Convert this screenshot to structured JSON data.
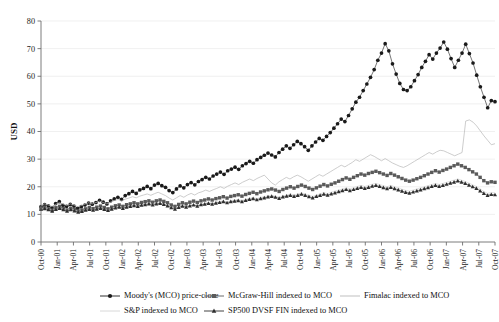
{
  "chart_data": {
    "type": "line",
    "title": "",
    "xlabel": "",
    "ylabel": "USD",
    "ylim": [
      0,
      80
    ],
    "yticks": [
      0,
      10,
      20,
      30,
      40,
      50,
      60,
      70,
      80
    ],
    "grid": true,
    "legend_position": "bottom",
    "tick_labels": [
      "Oct-00",
      "Jan-01",
      "Apr-01",
      "Jul-01",
      "Oct-01",
      "Jan-02",
      "Apr-02",
      "Jul-02",
      "Oct-02",
      "Jan-03",
      "Apr-03",
      "Jul-03",
      "Oct-03",
      "Jan-04",
      "Apr-04",
      "Jul-04",
      "Oct-04",
      "Jan-05",
      "Apr-05",
      "Jul-05",
      "Oct-05",
      "Jan-06",
      "Apr-06",
      "Jul-06",
      "Oct-06",
      "Jan-07",
      "Apr-07",
      "Jul-07",
      "Oct-07"
    ],
    "series": [
      {
        "name": "Moody's (MCO) price-close",
        "marker": "diamond",
        "color": "#1a1a1a",
        "values": [
          12.8,
          13.5,
          13.1,
          12.4,
          13.9,
          14.6,
          13.3,
          12.9,
          13.6,
          13.0,
          12.2,
          12.8,
          13.4,
          14.1,
          13.7,
          14.3,
          15.1,
          14.4,
          13.8,
          14.9,
          15.6,
          16.2,
          15.4,
          16.8,
          17.5,
          18.3,
          17.6,
          18.9,
          19.4,
          20.1,
          19.3,
          20.6,
          21.2,
          20.4,
          19.8,
          18.6,
          17.9,
          19.2,
          20.3,
          19.6,
          20.8,
          21.5,
          20.7,
          21.9,
          22.6,
          23.4,
          22.8,
          23.9,
          24.6,
          25.3,
          24.5,
          25.8,
          26.4,
          27.1,
          26.3,
          27.6,
          28.4,
          29.2,
          28.5,
          29.8,
          30.6,
          31.4,
          32.2,
          31.5,
          30.8,
          32.4,
          33.6,
          34.8,
          33.9,
          35.2,
          36.4,
          35.6,
          34.5,
          33.2,
          34.8,
          36.2,
          37.5,
          36.8,
          38.2,
          39.6,
          41.2,
          42.8,
          44.5,
          43.6,
          45.8,
          48.2,
          50.6,
          52.4,
          54.8,
          57.2,
          59.6,
          62.4,
          65.8,
          68.4,
          71.8,
          69.2,
          64.5,
          60.8,
          57.4,
          55.2,
          54.8,
          56.2,
          58.4,
          60.6,
          63.2,
          65.4,
          67.8,
          66.2,
          68.4,
          70.2,
          72.4,
          69.8,
          66.4,
          63.2,
          65.8,
          68.4,
          71.6,
          68.2,
          64.8,
          60.4,
          56.2,
          52.4,
          48.6,
          51.2,
          50.8
        ]
      },
      {
        "name": "McGraw-Hill indexed to MCO",
        "marker": "square",
        "color": "#5a5a5a",
        "values": [
          12.2,
          12.6,
          12.0,
          11.5,
          12.4,
          12.9,
          12.1,
          11.6,
          12.2,
          11.8,
          11.2,
          11.6,
          12.0,
          12.5,
          12.1,
          12.6,
          13.0,
          12.5,
          12.0,
          12.6,
          13.1,
          13.4,
          12.9,
          13.5,
          13.8,
          14.2,
          13.8,
          14.3,
          14.6,
          14.9,
          14.4,
          14.9,
          15.2,
          14.7,
          14.2,
          13.4,
          12.9,
          13.6,
          14.2,
          13.8,
          14.4,
          14.8,
          14.3,
          14.9,
          15.2,
          15.6,
          15.2,
          15.7,
          16.0,
          16.4,
          15.9,
          16.5,
          16.8,
          17.1,
          16.6,
          17.2,
          17.6,
          18.0,
          17.5,
          18.1,
          18.5,
          18.9,
          19.2,
          18.8,
          18.3,
          19.0,
          19.5,
          20.0,
          19.5,
          20.1,
          20.6,
          20.1,
          19.5,
          19.0,
          19.6,
          20.2,
          20.8,
          20.3,
          20.9,
          21.4,
          22.0,
          22.6,
          23.2,
          22.7,
          23.4,
          24.0,
          24.6,
          24.2,
          24.8,
          25.2,
          25.6,
          25.1,
          24.6,
          24.1,
          24.8,
          24.2,
          23.6,
          23.0,
          22.4,
          22.0,
          22.4,
          22.9,
          23.4,
          24.0,
          24.6,
          25.2,
          25.8,
          25.3,
          25.9,
          26.4,
          27.0,
          27.6,
          28.2,
          27.6,
          27.0,
          26.2,
          25.4,
          24.6,
          23.4,
          22.2,
          21.4,
          21.8,
          21.6
        ]
      },
      {
        "name": "Fimalac indexed to MCO",
        "marker": "none",
        "color": "#b8b8b8",
        "values": [
          13.2,
          13.8,
          13.4,
          12.9,
          13.6,
          14.2,
          13.8,
          13.2,
          13.8,
          13.4,
          12.8,
          13.2,
          13.7,
          14.2,
          13.8,
          14.3,
          14.8,
          14.3,
          13.8,
          14.4,
          15.0,
          15.4,
          14.9,
          15.5,
          15.9,
          16.4,
          16.0,
          16.6,
          17.0,
          17.4,
          16.9,
          17.5,
          18.0,
          17.4,
          16.8,
          15.9,
          15.2,
          16.0,
          16.8,
          16.2,
          17.0,
          17.6,
          17.0,
          17.8,
          18.2,
          18.8,
          18.3,
          18.9,
          19.4,
          20.0,
          19.4,
          20.2,
          20.8,
          21.4,
          20.8,
          21.6,
          22.2,
          22.8,
          22.2,
          23.0,
          23.6,
          24.2,
          22.8,
          21.4,
          20.6,
          21.8,
          22.6,
          23.4,
          22.8,
          23.6,
          24.2,
          23.6,
          22.8,
          22.0,
          22.8,
          23.6,
          24.4,
          23.8,
          24.6,
          25.4,
          26.2,
          27.0,
          27.8,
          27.2,
          28.0,
          28.8,
          29.8,
          29.2,
          30.0,
          30.8,
          31.6,
          31.0,
          30.2,
          29.4,
          30.2,
          29.4,
          28.6,
          28.0,
          27.4,
          27.0,
          27.6,
          28.4,
          29.2,
          30.0,
          30.8,
          31.6,
          32.4,
          31.8,
          32.6,
          33.2,
          33.0,
          32.4,
          31.8,
          31.2,
          31.8,
          32.4,
          43.8,
          44.2,
          43.4,
          42.0,
          40.2,
          38.4,
          36.8,
          35.2,
          35.6
        ]
      },
      {
        "name": "S&P indexed to MCO",
        "marker": "none",
        "color": "#d4d4d4",
        "values": [
          12.0,
          12.3,
          11.9,
          11.4,
          12.0,
          12.4,
          11.9,
          11.4,
          11.9,
          11.5,
          11.0,
          11.3,
          11.7,
          12.0,
          11.7,
          12.1,
          12.4,
          12.0,
          11.6,
          12.1,
          12.5,
          12.8,
          12.4,
          12.8,
          13.1,
          13.4,
          13.1,
          13.5,
          13.7,
          14.0,
          13.6,
          14.0,
          14.2,
          13.8,
          13.3,
          12.6,
          12.1,
          12.7,
          13.2,
          12.8,
          13.3,
          13.6,
          13.2,
          13.7,
          14.0,
          14.3,
          14.0,
          14.4,
          14.6,
          14.9,
          14.5,
          15.0,
          15.2,
          15.4,
          15.0,
          15.5,
          15.8,
          16.1,
          15.7,
          16.1,
          16.4,
          16.7,
          16.9,
          16.6,
          16.2,
          16.7,
          17.0,
          17.4,
          17.0,
          17.4,
          17.8,
          17.4,
          16.9,
          16.5,
          17.0,
          17.4,
          17.9,
          17.5,
          18.0,
          18.4,
          18.8,
          19.2,
          19.6,
          19.2,
          19.7,
          20.1,
          20.5,
          20.1,
          20.5,
          20.9,
          21.2,
          20.8,
          20.4,
          20.0,
          20.5,
          20.0,
          19.6,
          19.1,
          18.7,
          18.4,
          18.8,
          19.2,
          19.6,
          20.0,
          20.4,
          20.8,
          21.2,
          20.8,
          21.2,
          21.6,
          22.0,
          22.4,
          22.8,
          22.4,
          21.9,
          21.3,
          20.7,
          20.1,
          19.2,
          18.3,
          17.6,
          17.9,
          17.8
        ]
      },
      {
        "name": "SP500 DVSF FIN indexed to MCO",
        "marker": "triangle",
        "color": "#2e2e2e",
        "values": [
          11.8,
          12.1,
          11.7,
          11.2,
          11.8,
          12.2,
          11.7,
          11.2,
          11.7,
          11.3,
          10.8,
          11.1,
          11.5,
          11.8,
          11.5,
          11.9,
          12.2,
          11.8,
          11.4,
          11.9,
          12.3,
          12.6,
          12.2,
          12.6,
          12.9,
          13.2,
          12.9,
          13.3,
          13.5,
          13.8,
          13.4,
          13.8,
          14.0,
          13.6,
          13.1,
          12.4,
          11.9,
          12.5,
          13.0,
          12.6,
          13.1,
          13.4,
          13.0,
          13.5,
          13.7,
          14.0,
          13.7,
          14.1,
          14.3,
          14.6,
          14.2,
          14.6,
          14.8,
          15.0,
          14.6,
          15.1,
          15.4,
          15.7,
          15.3,
          15.7,
          16.0,
          16.3,
          16.5,
          16.2,
          15.8,
          16.3,
          16.6,
          16.9,
          16.5,
          16.9,
          17.3,
          16.9,
          16.4,
          16.0,
          16.5,
          16.9,
          17.3,
          17.0,
          17.4,
          17.8,
          18.2,
          18.6,
          19.0,
          18.6,
          19.0,
          19.4,
          19.8,
          19.4,
          19.8,
          20.2,
          20.5,
          20.1,
          19.7,
          19.3,
          19.8,
          19.3,
          18.9,
          18.4,
          18.0,
          17.7,
          18.1,
          18.5,
          18.9,
          19.3,
          19.7,
          20.1,
          20.5,
          20.1,
          20.5,
          20.9,
          21.3,
          21.7,
          22.1,
          21.7,
          21.2,
          20.6,
          20.0,
          19.4,
          18.5,
          17.6,
          16.9,
          17.2,
          17.1
        ]
      }
    ]
  },
  "legend": {
    "entries": [
      {
        "label": "Moody's (MCO) price-close",
        "marker": "diamond",
        "color": "#1a1a1a"
      },
      {
        "label": "McGraw-Hill indexed to MCO",
        "marker": "square",
        "color": "#5a5a5a"
      },
      {
        "label": "Fimalac indexed to MCO",
        "marker": "none",
        "color": "#b8b8b8"
      },
      {
        "label": "S&P indexed to MCO",
        "marker": "none",
        "color": "#d4d4d4"
      },
      {
        "label": "SP500 DVSF FIN indexed to MCO",
        "marker": "triangle",
        "color": "#2e2e2e"
      }
    ]
  }
}
